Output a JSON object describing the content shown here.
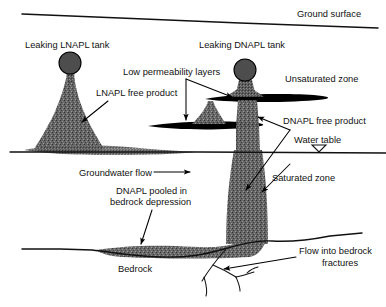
{
  "figure": {
    "background_color": "#ffffff",
    "line_color": "#111111",
    "plume_color": "#5f5f5f",
    "lens_color": "#000000",
    "tank_color": "#4d4d4d",
    "text_color": "#111111"
  },
  "labels": {
    "ground_surface": "Ground surface",
    "leaking_lnapl_tank": "Leaking LNAPL tank",
    "leaking_dnapl_tank": "Leaking DNAPL tank",
    "low_permeability_layers": "Low permeability layers",
    "unsaturated_zone": "Unsaturated zone",
    "lnapl_free_product": "LNAPL free product",
    "dnapl_free_product": "DNAPL free product",
    "water_table": "Water table",
    "groundwater_flow": "Groundwater flow",
    "saturated_zone": "Saturated zone",
    "dnapl_pooled_line1": "DNAPL pooled in",
    "dnapl_pooled_line2": "bedrock depression",
    "bedrock": "Bedrock",
    "flow_into_bedrock_line1": "Flow into bedrock",
    "flow_into_bedrock_line2": "fractures"
  },
  "features": {
    "zones": [
      "Unsaturated zone",
      "Saturated zone",
      "Bedrock"
    ],
    "tanks": [
      {
        "name": "Leaking LNAPL tank",
        "type": "LNAPL",
        "cx": 70,
        "cy": 63,
        "r": 11
      },
      {
        "name": "Leaking DNAPL tank",
        "type": "DNAPL",
        "cx": 245,
        "cy": 70,
        "r": 11
      }
    ],
    "low_permeability_layers_count": 2,
    "water_table_symbol": "inverted-triangle",
    "groundwater_flow_direction": "left-to-right",
    "fracture_network": "branching"
  }
}
